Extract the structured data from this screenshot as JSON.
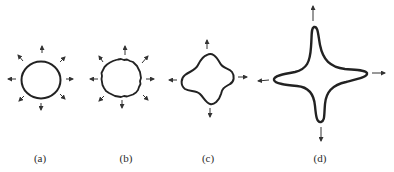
{
  "figure": {
    "panels": [
      {
        "id": "a",
        "label": "(a)",
        "description": "smooth circle with eight outward arrows"
      },
      {
        "id": "b",
        "label": "(b)",
        "description": "circle with slightly rough/perturbed boundary and eight outward arrows"
      },
      {
        "id": "c",
        "label": "(c)",
        "description": "four-lobed rounded shape with four outward arrows"
      },
      {
        "id": "d",
        "label": "(d)",
        "description": "four-pointed star with elongated tips and four outward arrows"
      }
    ],
    "colors": {
      "stroke": "#222222",
      "background": "#ffffff"
    }
  }
}
